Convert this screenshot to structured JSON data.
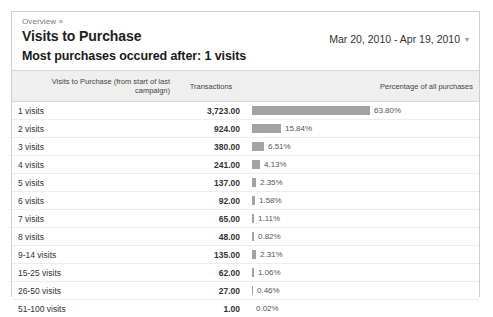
{
  "panel": {
    "breadcrumb": "Overview »",
    "page_title": "Visits to Purchase",
    "date_range": "Mar 20, 2010 - Apr 19, 2010",
    "date_range_caret": "▾",
    "summary": "Most purchases occured after: 1 visits"
  },
  "table": {
    "headers": {
      "label": "Visits to Purchase (from start of last campaign)",
      "transactions": "Transactions",
      "percentage": "Percentage of all purchases"
    }
  },
  "chart_data": {
    "type": "bar",
    "title": "Visits to Purchase",
    "subtitle": "Most purchases occured after: 1 visits",
    "xlabel": "Percentage of all purchases",
    "ylabel": "Visits to Purchase (from start of last campaign)",
    "orientation": "horizontal",
    "grid": false,
    "legend": "none",
    "xlim": [
      0,
      63.8
    ],
    "categories": [
      "1 visits",
      "2 visits",
      "3 visits",
      "4 visits",
      "5 visits",
      "6 visits",
      "7 visits",
      "8 visits",
      "9-14 visits",
      "15-25 visits",
      "26-50 visits",
      "51-100 visits"
    ],
    "series": [
      {
        "name": "Transactions",
        "values": [
          3723,
          924,
          380,
          241,
          137,
          92,
          65,
          48,
          135,
          62,
          27,
          1
        ]
      },
      {
        "name": "Percentage of all purchases",
        "values": [
          63.8,
          15.84,
          6.51,
          4.13,
          2.35,
          1.58,
          1.11,
          0.82,
          2.31,
          1.06,
          0.46,
          0.02
        ]
      }
    ],
    "rows": [
      {
        "label": "1 visits",
        "transactions": "3,723.00",
        "percentage": "63.80%",
        "pct_value": 63.8
      },
      {
        "label": "2 visits",
        "transactions": "924.00",
        "percentage": "15.84%",
        "pct_value": 15.84
      },
      {
        "label": "3 visits",
        "transactions": "380.00",
        "percentage": "6.51%",
        "pct_value": 6.51
      },
      {
        "label": "4 visits",
        "transactions": "241.00",
        "percentage": "4.13%",
        "pct_value": 4.13
      },
      {
        "label": "5 visits",
        "transactions": "137.00",
        "percentage": "2.35%",
        "pct_value": 2.35
      },
      {
        "label": "6 visits",
        "transactions": "92.00",
        "percentage": "1.58%",
        "pct_value": 1.58
      },
      {
        "label": "7 visits",
        "transactions": "65.00",
        "percentage": "1.11%",
        "pct_value": 1.11
      },
      {
        "label": "8 visits",
        "transactions": "48.00",
        "percentage": "0.82%",
        "pct_value": 0.82
      },
      {
        "label": "9-14 visits",
        "transactions": "135.00",
        "percentage": "2.31%",
        "pct_value": 2.31
      },
      {
        "label": "15-25 visits",
        "transactions": "62.00",
        "percentage": "1.06%",
        "pct_value": 1.06
      },
      {
        "label": "26-50 visits",
        "transactions": "27.00",
        "percentage": "0.46%",
        "pct_value": 0.46
      },
      {
        "label": "51-100 visits",
        "transactions": "1.00",
        "percentage": "0.02%",
        "pct_value": 0.02
      }
    ]
  },
  "colors": {
    "bar": "#a3a3a3",
    "panel_border": "#cfcfcf",
    "header_bg": "#efefef"
  }
}
